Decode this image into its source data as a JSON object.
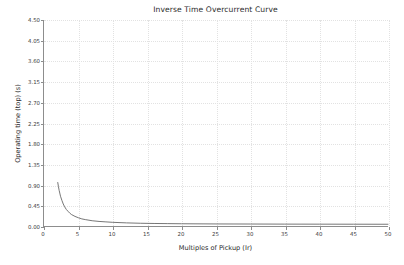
{
  "chart_data": {
    "type": "line",
    "title": "Inverse Time Overcurrent Curve",
    "xlabel": "Multiples of Pickup (Ir)",
    "ylabel": "Operating time (top) (s)",
    "xlim": [
      0,
      50
    ],
    "ylim": [
      0.0,
      4.5
    ],
    "grid": true,
    "legend": null,
    "xticks": [
      0,
      5,
      10,
      15,
      20,
      25,
      30,
      35,
      40,
      45,
      50
    ],
    "xtick_labels": [
      "0",
      "5",
      "10",
      "15",
      "20",
      "25",
      "30",
      "35",
      "40",
      "45",
      "50"
    ],
    "yticks": [
      0.0,
      0.45,
      0.9,
      1.35,
      1.8,
      2.25,
      2.7,
      3.15,
      3.6,
      4.05,
      4.5
    ],
    "ytick_labels": [
      "0.00",
      "0.45",
      "0.90",
      "1.35",
      "1.80",
      "2.25",
      "2.70",
      "3.15",
      "3.60",
      "4.05",
      "4.50"
    ],
    "series": [
      {
        "name": "Operating time",
        "color": "#666666",
        "x": [
          2.0,
          2.1,
          2.2,
          2.4,
          2.6,
          2.8,
          3.0,
          3.25,
          3.5,
          3.75,
          4.0,
          4.5,
          5.0,
          5.5,
          6.0,
          7.0,
          8.0,
          9.0,
          10.0,
          12.0,
          14.0,
          16.0,
          18.0,
          20.0,
          25.0,
          30.0,
          35.0,
          40.0,
          45.0,
          50.0
        ],
        "y": [
          0.95,
          0.86,
          0.78,
          0.65,
          0.56,
          0.48,
          0.42,
          0.36,
          0.32,
          0.28,
          0.25,
          0.21,
          0.18,
          0.155,
          0.14,
          0.115,
          0.1,
          0.09,
          0.08,
          0.068,
          0.06,
          0.055,
          0.052,
          0.049,
          0.045,
          0.043,
          0.041,
          0.04,
          0.039,
          0.038
        ]
      }
    ]
  }
}
